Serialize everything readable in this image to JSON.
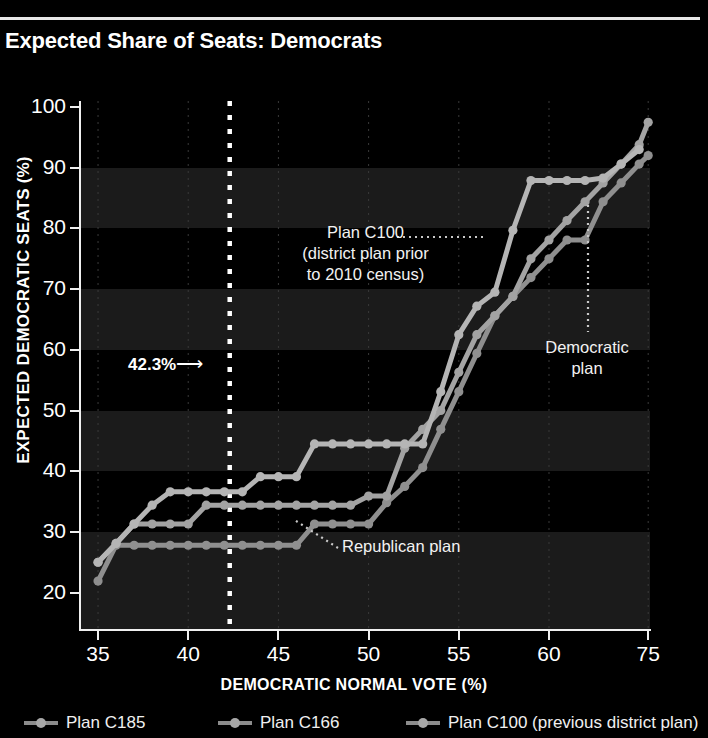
{
  "header": {
    "title": "Expected Share of Seats: Democrats"
  },
  "axes": {
    "x_title": "DEMOCRATIC NORMAL VOTE (%)",
    "y_title": "EXPECTED DEMOCRATIC SEATS (%)",
    "x_ticks": [
      "35",
      "40",
      "45",
      "50",
      "55",
      "60",
      "75"
    ],
    "y_ticks": [
      "100",
      "90",
      "80",
      "70",
      "60",
      "50",
      "40",
      "30",
      "20"
    ]
  },
  "annotations": {
    "plan_c100": "Plan C100\n(district plan prior\nto 2010 census)",
    "democratic_plan": "Democratic\nplan",
    "republican_plan": "Republican plan",
    "threshold": "42.3%",
    "threshold_arrow": "⟶"
  },
  "legend": {
    "items": [
      {
        "label": "Plan C185",
        "color": "#9a9a9a"
      },
      {
        "label": "Plan C166",
        "color": "#9a9a9a"
      },
      {
        "label": "Plan C100 (previous district plan)",
        "color": "#9a9a9a"
      }
    ]
  },
  "chart_data": {
    "type": "line",
    "title": "Expected Share of Seats: Democrats",
    "xlabel": "DEMOCRATIC NORMAL VOTE (%)",
    "ylabel": "EXPECTED DEMOCRATIC SEATS (%)",
    "xlim": [
      34,
      65.6
    ],
    "ylim": [
      14,
      101
    ],
    "grid": "horizontal-bands",
    "legend_position": "bottom",
    "threshold_line": {
      "x": 42.3,
      "label": "42.3%",
      "style": "dotted",
      "color": "#ffffff"
    },
    "series": [
      {
        "name": "Plan C185",
        "role": "Republican plan",
        "color": "#8f8f8f",
        "points": [
          [
            35,
            21.9
          ],
          [
            36,
            27.8
          ],
          [
            37,
            27.8
          ],
          [
            38,
            27.8
          ],
          [
            39,
            27.8
          ],
          [
            40,
            27.8
          ],
          [
            41,
            27.8
          ],
          [
            42,
            27.8
          ],
          [
            43,
            27.8
          ],
          [
            44,
            27.8
          ],
          [
            45,
            27.8
          ],
          [
            46,
            27.8
          ],
          [
            47,
            31.3
          ],
          [
            48,
            31.3
          ],
          [
            49,
            31.3
          ],
          [
            50,
            31.3
          ],
          [
            51,
            34.8
          ],
          [
            52,
            37.5
          ],
          [
            53,
            40.6
          ],
          [
            54,
            46.9
          ],
          [
            55,
            53.1
          ],
          [
            56,
            59.4
          ],
          [
            57,
            65.6
          ],
          [
            58,
            68.8
          ],
          [
            59,
            71.9
          ],
          [
            60,
            75.0
          ],
          [
            61,
            78.1
          ],
          [
            62,
            78.1
          ],
          [
            63,
            84.4
          ],
          [
            64,
            87.5
          ],
          [
            65,
            90.6
          ],
          [
            65.5,
            92.0
          ]
        ]
      },
      {
        "name": "Plan C166",
        "role": "Democratic plan",
        "color": "#a3a3a3",
        "points": [
          [
            35,
            25.0
          ],
          [
            36,
            28.1
          ],
          [
            37,
            31.3
          ],
          [
            38,
            31.3
          ],
          [
            39,
            31.3
          ],
          [
            40,
            31.3
          ],
          [
            41,
            34.4
          ],
          [
            42,
            34.4
          ],
          [
            43,
            34.4
          ],
          [
            44,
            34.4
          ],
          [
            45,
            34.4
          ],
          [
            46,
            34.4
          ],
          [
            47,
            34.4
          ],
          [
            48,
            34.4
          ],
          [
            49,
            34.4
          ],
          [
            50,
            35.9
          ],
          [
            51,
            35.9
          ],
          [
            52,
            43.8
          ],
          [
            53,
            46.9
          ],
          [
            54,
            50.0
          ],
          [
            55,
            56.3
          ],
          [
            56,
            62.5
          ],
          [
            57,
            65.6
          ],
          [
            58,
            68.8
          ],
          [
            59,
            75.0
          ],
          [
            60,
            78.1
          ],
          [
            61,
            81.3
          ],
          [
            62,
            84.4
          ],
          [
            63,
            87.5
          ],
          [
            64,
            90.6
          ],
          [
            65,
            93.8
          ],
          [
            65.5,
            97.5
          ]
        ]
      },
      {
        "name": "Plan C100 (previous district plan)",
        "color": "#b5b5b5",
        "points": [
          [
            35,
            25.0
          ],
          [
            36,
            28.1
          ],
          [
            37,
            31.3
          ],
          [
            38,
            34.4
          ],
          [
            39,
            36.6
          ],
          [
            40,
            36.6
          ],
          [
            41,
            36.6
          ],
          [
            42,
            36.6
          ],
          [
            43,
            36.6
          ],
          [
            44,
            39.1
          ],
          [
            45,
            39.1
          ],
          [
            46,
            39.1
          ],
          [
            47,
            44.5
          ],
          [
            48,
            44.5
          ],
          [
            49,
            44.5
          ],
          [
            50,
            44.5
          ],
          [
            51,
            44.5
          ],
          [
            52,
            44.5
          ],
          [
            53,
            44.5
          ],
          [
            54,
            53.1
          ],
          [
            55,
            62.5
          ],
          [
            56,
            67.2
          ],
          [
            57,
            69.5
          ],
          [
            58,
            79.7
          ],
          [
            59,
            87.9
          ],
          [
            60,
            87.9
          ],
          [
            61,
            87.9
          ],
          [
            62,
            87.9
          ],
          [
            63,
            88.3
          ],
          [
            64,
            90.6
          ],
          [
            65,
            93.0
          ]
        ]
      }
    ]
  }
}
